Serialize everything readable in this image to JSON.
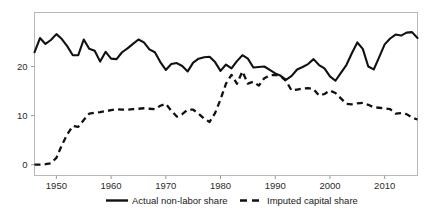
{
  "chart_data": {
    "type": "line",
    "title": "",
    "subtitle": "",
    "xlabel": "",
    "ylabel": "",
    "xlim": [
      1946,
      2016
    ],
    "ylim": [
      -2.2,
      31
    ],
    "grid": false,
    "legend_position": "below-axes",
    "xticks": [
      1950,
      1960,
      1970,
      1980,
      1990,
      2000,
      2010
    ],
    "xticklabels": [
      "1950",
      "1960",
      "1970",
      "1980",
      "1990",
      "2000",
      "2010"
    ],
    "yticks": [
      0,
      10,
      20
    ],
    "yticklabels": [
      "0",
      "10",
      "20"
    ],
    "x": [
      1946,
      1947,
      1948,
      1949,
      1950,
      1951,
      1952,
      1953,
      1954,
      1955,
      1956,
      1957,
      1958,
      1959,
      1960,
      1961,
      1962,
      1963,
      1964,
      1965,
      1966,
      1967,
      1968,
      1969,
      1970,
      1971,
      1972,
      1973,
      1974,
      1975,
      1976,
      1977,
      1978,
      1979,
      1980,
      1981,
      1982,
      1983,
      1984,
      1985,
      1986,
      1987,
      1988,
      1989,
      1990,
      1991,
      1992,
      1993,
      1994,
      1995,
      1996,
      1997,
      1998,
      1999,
      2000,
      2001,
      2002,
      2003,
      2004,
      2005,
      2006,
      2007,
      2008,
      2009,
      2010,
      2011,
      2012,
      2013,
      2014,
      2015,
      2016
    ],
    "series": [
      {
        "name": "Actual non-labor share",
        "style": "solid",
        "color": "#111111",
        "values": [
          22.9,
          25.8,
          24.6,
          25.4,
          26.6,
          25.6,
          24.1,
          22.3,
          22.3,
          25.5,
          23.6,
          23.2,
          21.0,
          23.0,
          21.6,
          21.5,
          22.9,
          23.7,
          24.6,
          25.5,
          24.9,
          23.5,
          22.9,
          20.9,
          19.3,
          20.5,
          20.7,
          20.1,
          19.0,
          20.8,
          21.6,
          21.9,
          22.0,
          20.9,
          19.1,
          20.4,
          19.6,
          21.1,
          22.3,
          21.6,
          19.8,
          19.9,
          20.0,
          19.3,
          18.6,
          18.1,
          17.3,
          18.1,
          19.4,
          19.9,
          20.5,
          21.5,
          20.3,
          19.6,
          18.0,
          17.1,
          18.7,
          20.3,
          22.7,
          24.9,
          23.6,
          20.0,
          19.4,
          21.9,
          24.5,
          25.7,
          26.5,
          26.3,
          26.9,
          27.0,
          25.8
        ]
      },
      {
        "name": "Imputed capital share",
        "style": "dashed",
        "color": "#111111",
        "values": [
          0.0,
          0.0,
          0.1,
          0.3,
          1.4,
          4.0,
          6.2,
          7.9,
          7.7,
          9.1,
          10.4,
          10.6,
          10.7,
          10.9,
          11.1,
          11.3,
          11.2,
          11.2,
          11.3,
          11.4,
          11.5,
          11.4,
          11.3,
          12.0,
          12.4,
          11.0,
          9.8,
          10.3,
          11.2,
          11.2,
          10.4,
          9.4,
          8.7,
          10.5,
          13.3,
          16.5,
          18.3,
          16.5,
          19.0,
          16.5,
          16.9,
          16.1,
          17.6,
          18.2,
          18.3,
          18.0,
          17.0,
          15.1,
          15.3,
          15.5,
          15.6,
          15.4,
          14.1,
          14.4,
          15.1,
          14.6,
          13.5,
          12.4,
          12.3,
          12.5,
          12.6,
          12.2,
          11.7,
          11.6,
          11.5,
          11.3,
          10.4,
          10.5,
          10.3,
          9.6,
          9.2
        ]
      }
    ],
    "legend": [
      {
        "label": "Actual non-labor share",
        "style": "solid"
      },
      {
        "label": "Imputed capital share",
        "style": "dashed"
      }
    ]
  }
}
